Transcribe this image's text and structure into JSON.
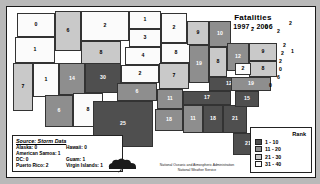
{
  "title": {
    "line1": "Fatalities",
    "line2": "1997 - 2006"
  },
  "legend": {
    "header": "Rank",
    "items": [
      {
        "label": "1 - 10",
        "color": "#4f4f4f",
        "class": "c1"
      },
      {
        "label": "11 - 20",
        "color": "#8e8e8e",
        "class": "c2"
      },
      {
        "label": "21 - 30",
        "color": "#c9c9c9",
        "class": "c3"
      },
      {
        "label": "31 - 40",
        "color": "#fbfbfb",
        "class": "c4"
      }
    ]
  },
  "source": {
    "header": "Source: Storm Data",
    "rows": [
      {
        "a": "Alaska: 0",
        "b": "Hawaii: 0"
      },
      {
        "a": "American Samoa: 1",
        "b": ""
      },
      {
        "a": "DC: 0",
        "b": "Guam: 1"
      },
      {
        "a": "Puerto Rico: 2",
        "b": "Virgin Islands: 1"
      }
    ]
  },
  "credit": "National Oceanic and Atmospheric Administration\nNational Weather Service",
  "chart_data": {
    "type": "choropleth",
    "title": "Fatalities 1997 - 2006",
    "value_label": "Fatalities",
    "legend_title": "Rank",
    "bins": [
      {
        "label": "1 - 10",
        "min": 1,
        "max": 10,
        "color": "#4f4f4f"
      },
      {
        "label": "11 - 20",
        "min": 11,
        "max": 20,
        "color": "#8e8e8e"
      },
      {
        "label": "21 - 30",
        "min": 21,
        "max": 30,
        "color": "#c9c9c9"
      },
      {
        "label": "31 - 40",
        "min": 31,
        "max": 40,
        "color": "#fbfbfb"
      }
    ],
    "regions": [
      {
        "code": "WA",
        "value": 0
      },
      {
        "code": "OR",
        "value": 1
      },
      {
        "code": "CA",
        "value": 7
      },
      {
        "code": "ID",
        "value": 6
      },
      {
        "code": "NV",
        "value": 1
      },
      {
        "code": "MT",
        "value": 2
      },
      {
        "code": "WY",
        "value": 8
      },
      {
        "code": "UT",
        "value": 14
      },
      {
        "code": "CO",
        "value": 30
      },
      {
        "code": "AZ",
        "value": 6
      },
      {
        "code": "NM",
        "value": 8
      },
      {
        "code": "ND",
        "value": 1
      },
      {
        "code": "SD",
        "value": 3
      },
      {
        "code": "NE",
        "value": 4
      },
      {
        "code": "KS",
        "value": 2
      },
      {
        "code": "OK",
        "value": 6
      },
      {
        "code": "TX",
        "value": 25
      },
      {
        "code": "MN",
        "value": 2
      },
      {
        "code": "IA",
        "value": 8
      },
      {
        "code": "MO",
        "value": 7
      },
      {
        "code": "AR",
        "value": 11
      },
      {
        "code": "LA",
        "value": 18
      },
      {
        "code": "WI",
        "value": 9
      },
      {
        "code": "IL",
        "value": 19
      },
      {
        "code": "MI",
        "value": 10
      },
      {
        "code": "IN",
        "value": 8
      },
      {
        "code": "OH",
        "value": 12
      },
      {
        "code": "KY",
        "value": 12
      },
      {
        "code": "TN",
        "value": 17
      },
      {
        "code": "MS",
        "value": 11
      },
      {
        "code": "AL",
        "value": 18
      },
      {
        "code": "GA",
        "value": 21
      },
      {
        "code": "FL",
        "value": 21
      },
      {
        "code": "SC",
        "value": 15
      },
      {
        "code": "NC",
        "value": 19
      },
      {
        "code": "VA",
        "value": 8
      },
      {
        "code": "WV",
        "value": 2
      },
      {
        "code": "MD",
        "value": 6
      },
      {
        "code": "DE",
        "value": 0
      },
      {
        "code": "PA",
        "value": 9
      },
      {
        "code": "NJ",
        "value": 2
      },
      {
        "code": "NY",
        "value": 2
      },
      {
        "code": "CT",
        "value": 2
      },
      {
        "code": "RI",
        "value": 0
      },
      {
        "code": "MA",
        "value": 2
      },
      {
        "code": "VT",
        "value": 0
      },
      {
        "code": "NH",
        "value": 2
      },
      {
        "code": "ME",
        "value": 2
      },
      {
        "code": "AK",
        "value": 0
      },
      {
        "code": "HI",
        "value": 0
      },
      {
        "code": "DC",
        "value": 0
      },
      {
        "code": "PR",
        "value": 2
      },
      {
        "code": "VI",
        "value": 1
      },
      {
        "code": "GU",
        "value": 1
      },
      {
        "code": "AS",
        "value": 1
      }
    ]
  },
  "states": [
    {
      "code": "WA",
      "label": "0",
      "cls": "c4",
      "x": 10,
      "y": 6,
      "w": 38,
      "h": 24
    },
    {
      "code": "OR",
      "label": "1",
      "cls": "c4",
      "x": 8,
      "y": 30,
      "w": 40,
      "h": 26
    },
    {
      "code": "ID",
      "label": "6",
      "cls": "c3",
      "x": 48,
      "y": 4,
      "w": 26,
      "h": 40
    },
    {
      "code": "MT",
      "label": "2",
      "cls": "c4",
      "x": 74,
      "y": 4,
      "w": 48,
      "h": 30
    },
    {
      "code": "WY",
      "label": "8",
      "cls": "c3",
      "x": 74,
      "y": 34,
      "w": 40,
      "h": 24
    },
    {
      "code": "NV",
      "label": "1",
      "cls": "c4",
      "x": 26,
      "y": 56,
      "w": 26,
      "h": 34
    },
    {
      "code": "CA",
      "label": "7",
      "cls": "c3",
      "x": 6,
      "y": 56,
      "w": 20,
      "h": 48
    },
    {
      "code": "UT",
      "label": "14",
      "cls": "c2",
      "x": 52,
      "y": 56,
      "w": 26,
      "h": 32
    },
    {
      "code": "CO",
      "label": "30",
      "cls": "c1",
      "x": 78,
      "y": 56,
      "w": 36,
      "h": 30
    },
    {
      "code": "AZ",
      "label": "6",
      "cls": "c2",
      "x": 38,
      "y": 88,
      "w": 28,
      "h": 32
    },
    {
      "code": "NM",
      "label": "8",
      "cls": "c4",
      "x": 66,
      "y": 86,
      "w": 30,
      "h": 34
    },
    {
      "code": "ND",
      "label": "1",
      "cls": "c4",
      "x": 122,
      "y": 4,
      "w": 32,
      "h": 18
    },
    {
      "code": "SD",
      "label": "3",
      "cls": "c4",
      "x": 122,
      "y": 22,
      "w": 32,
      "h": 18
    },
    {
      "code": "NE",
      "label": "4",
      "cls": "c4",
      "x": 118,
      "y": 40,
      "w": 36,
      "h": 18
    },
    {
      "code": "KS",
      "label": "2",
      "cls": "c4",
      "x": 114,
      "y": 58,
      "w": 38,
      "h": 18
    },
    {
      "code": "OK",
      "label": "6",
      "cls": "c2",
      "x": 110,
      "y": 76,
      "w": 40,
      "h": 18
    },
    {
      "code": "TX",
      "label": "25",
      "cls": "c1",
      "x": 86,
      "y": 94,
      "w": 60,
      "h": 46
    },
    {
      "code": "MN",
      "label": "2",
      "cls": "c4",
      "x": 154,
      "y": 6,
      "w": 26,
      "h": 30
    },
    {
      "code": "IA",
      "label": "8",
      "cls": "c4",
      "x": 154,
      "y": 36,
      "w": 30,
      "h": 20
    },
    {
      "code": "MO",
      "label": "7",
      "cls": "c3",
      "x": 152,
      "y": 56,
      "w": 30,
      "h": 26
    },
    {
      "code": "AR",
      "label": "11",
      "cls": "c2",
      "x": 150,
      "y": 82,
      "w": 26,
      "h": 20
    },
    {
      "code": "LA",
      "label": "18",
      "cls": "c2",
      "x": 148,
      "y": 102,
      "w": 28,
      "h": 22
    },
    {
      "code": "WI",
      "label": "9",
      "cls": "c3",
      "x": 180,
      "y": 14,
      "w": 22,
      "h": 24
    },
    {
      "code": "IL",
      "label": "19",
      "cls": "c2",
      "x": 182,
      "y": 38,
      "w": 20,
      "h": 38
    },
    {
      "code": "MI",
      "label": "10",
      "cls": "c2",
      "x": 202,
      "y": 14,
      "w": 22,
      "h": 26
    },
    {
      "code": "IN",
      "label": "8",
      "cls": "c3",
      "x": 202,
      "y": 40,
      "w": 18,
      "h": 30
    },
    {
      "code": "OH",
      "label": "12",
      "cls": "c2",
      "x": 220,
      "y": 36,
      "w": 22,
      "h": 28
    },
    {
      "code": "KY",
      "label": "12",
      "cls": "c1",
      "x": 202,
      "y": 70,
      "w": 40,
      "h": 14
    },
    {
      "code": "TN",
      "label": "17",
      "cls": "c1",
      "x": 176,
      "y": 84,
      "w": 48,
      "h": 14
    },
    {
      "code": "MS",
      "label": "11",
      "cls": "c2",
      "x": 176,
      "y": 98,
      "w": 20,
      "h": 28
    },
    {
      "code": "AL",
      "label": "18",
      "cls": "c1",
      "x": 196,
      "y": 98,
      "w": 20,
      "h": 28
    },
    {
      "code": "GA",
      "label": "21",
      "cls": "c1",
      "x": 216,
      "y": 98,
      "w": 24,
      "h": 28
    },
    {
      "code": "FL",
      "label": "21",
      "cls": "c1",
      "x": 226,
      "y": 126,
      "w": 30,
      "h": 22
    },
    {
      "code": "SC",
      "label": "15",
      "cls": "c1",
      "x": 228,
      "y": 84,
      "w": 24,
      "h": 16
    },
    {
      "code": "NC",
      "label": "19",
      "cls": "c2",
      "x": 224,
      "y": 70,
      "w": 40,
      "h": 14
    },
    {
      "code": "VA",
      "label": "8",
      "cls": "c3",
      "x": 242,
      "y": 54,
      "w": 28,
      "h": 16
    },
    {
      "code": "WV",
      "label": "2",
      "cls": "c4",
      "x": 228,
      "y": 56,
      "w": 16,
      "h": 12
    },
    {
      "code": "PA",
      "label": "9",
      "cls": "c3",
      "x": 242,
      "y": 36,
      "w": 28,
      "h": 18
    }
  ],
  "small_labels": [
    {
      "name": "ny-label",
      "label": "2",
      "x": 244,
      "y": 20
    },
    {
      "name": "vt-label",
      "label": "0",
      "x": 258,
      "y": 18
    },
    {
      "name": "nh-label",
      "label": "2",
      "x": 270,
      "y": 22
    },
    {
      "name": "me-label",
      "label": "2",
      "x": 282,
      "y": 14
    },
    {
      "name": "ma-label",
      "label": "2",
      "x": 276,
      "y": 36
    },
    {
      "name": "ct-label",
      "label": "2",
      "x": 274,
      "y": 44
    },
    {
      "name": "ri-label",
      "label": "1",
      "x": 284,
      "y": 42
    },
    {
      "name": "nj-label",
      "label": "2",
      "x": 272,
      "y": 52
    },
    {
      "name": "de-label",
      "label": "0",
      "x": 272,
      "y": 60
    },
    {
      "name": "md-label",
      "label": "6",
      "x": 270,
      "y": 68
    },
    {
      "name": "dc-label",
      "label": "0",
      "x": 262,
      "y": 76
    }
  ]
}
